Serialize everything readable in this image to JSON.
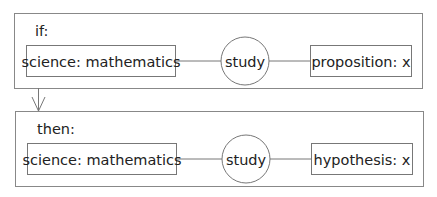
{
  "diagram": {
    "if_block": {
      "label": "if:",
      "left_node": "science:  mathematics",
      "relation": "study",
      "right_node": "proposition:  x"
    },
    "then_block": {
      "label": "then:",
      "left_node": "science:  mathematics",
      "relation": "study",
      "right_node": "hypothesis:  x"
    },
    "colors": {
      "stroke": "#777777",
      "text": "#222222",
      "background": "#ffffff"
    }
  }
}
